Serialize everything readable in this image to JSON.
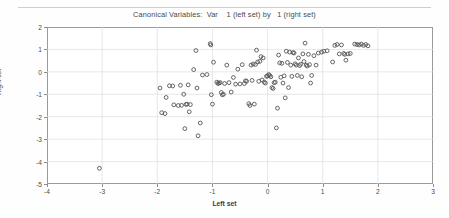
{
  "figure": {
    "title": "Canonical Variables:  Var    1 (left set) by   1 (right set)",
    "xlabel": "Left set",
    "ylabel": "Right set"
  },
  "chart_data": {
    "type": "scatter",
    "title": "Canonical Variables:  Var    1 (left set) by   1 (right set)",
    "xlabel": "Left set",
    "ylabel": "Right set",
    "xlim": [
      -4,
      3
    ],
    "ylim": [
      -5,
      2
    ],
    "xticks": [
      -4,
      -3,
      -2,
      -1,
      0,
      1,
      2,
      3
    ],
    "yticks": [
      -5,
      -4,
      -3,
      -2,
      -1,
      0,
      1,
      2
    ],
    "grid": true,
    "legend": null,
    "marker": "open-circle",
    "marker_color": "#555555",
    "series": [
      {
        "name": "observations",
        "points": [
          [
            -3.05,
            -4.3
          ],
          [
            -1.95,
            -0.72
          ],
          [
            -1.92,
            -1.82
          ],
          [
            -1.86,
            -1.86
          ],
          [
            -1.84,
            -1.14
          ],
          [
            -1.78,
            -0.62
          ],
          [
            -1.72,
            -0.63
          ],
          [
            -1.7,
            -1.47
          ],
          [
            -1.62,
            -1.5
          ],
          [
            -1.58,
            -0.6
          ],
          [
            -1.56,
            -1.49
          ],
          [
            -1.52,
            -1.0
          ],
          [
            -1.5,
            -2.53
          ],
          [
            -1.48,
            -1.45
          ],
          [
            -1.46,
            -1.44
          ],
          [
            -1.44,
            -0.58
          ],
          [
            -1.42,
            -1.78
          ],
          [
            -1.4,
            -1.46
          ],
          [
            -1.34,
            0.1
          ],
          [
            -1.3,
            0.95
          ],
          [
            -1.28,
            -0.72
          ],
          [
            -1.26,
            -2.85
          ],
          [
            -1.22,
            -2.28
          ],
          [
            -1.18,
            -0.14
          ],
          [
            -1.1,
            -0.12
          ],
          [
            -1.04,
            1.26
          ],
          [
            -1.03,
            1.2
          ],
          [
            -1.02,
            -1.02
          ],
          [
            -1.0,
            -1.44
          ],
          [
            -0.98,
            0.43
          ],
          [
            -0.92,
            -0.46
          ],
          [
            -0.9,
            -0.52
          ],
          [
            -0.88,
            -0.5
          ],
          [
            -0.86,
            -0.48
          ],
          [
            -0.84,
            -0.92
          ],
          [
            -0.82,
            -1.02
          ],
          [
            -0.8,
            -1.0
          ],
          [
            -0.78,
            -0.52
          ],
          [
            -0.74,
            0.3
          ],
          [
            -0.7,
            -0.48
          ],
          [
            -0.66,
            -0.9
          ],
          [
            -0.62,
            -0.25
          ],
          [
            -0.58,
            -0.55
          ],
          [
            -0.54,
            0.12
          ],
          [
            -0.5,
            -0.54
          ],
          [
            -0.46,
            0.32
          ],
          [
            -0.42,
            -0.52
          ],
          [
            -0.4,
            -0.4
          ],
          [
            -0.38,
            -0.42
          ],
          [
            -0.34,
            -1.42
          ],
          [
            -0.32,
            -1.5
          ],
          [
            -0.3,
            0.3
          ],
          [
            -0.28,
            -0.38
          ],
          [
            -0.26,
            0.35
          ],
          [
            -0.24,
            -1.44
          ],
          [
            -0.22,
            0.33
          ],
          [
            -0.2,
            0.97
          ],
          [
            -0.18,
            0.44
          ],
          [
            -0.16,
            -0.42
          ],
          [
            -0.14,
            0.47
          ],
          [
            -0.12,
            0.68
          ],
          [
            -0.1,
            -0.36
          ],
          [
            -0.08,
            0.62
          ],
          [
            -0.06,
            -0.46
          ],
          [
            -0.04,
            -0.5
          ],
          [
            -0.02,
            -0.2
          ],
          [
            0.0,
            -0.18
          ],
          [
            0.02,
            -0.12
          ],
          [
            0.04,
            -0.16
          ],
          [
            0.06,
            -0.22
          ],
          [
            0.08,
            -0.7
          ],
          [
            0.1,
            -0.74
          ],
          [
            0.12,
            -0.48
          ],
          [
            0.14,
            -0.46
          ],
          [
            0.16,
            -2.5
          ],
          [
            0.18,
            -1.62
          ],
          [
            0.2,
            0.75
          ],
          [
            0.22,
            0.4
          ],
          [
            0.24,
            -0.24
          ],
          [
            0.26,
            0.38
          ],
          [
            0.28,
            -0.5
          ],
          [
            0.3,
            -0.18
          ],
          [
            0.32,
            -1.16
          ],
          [
            0.34,
            0.92
          ],
          [
            0.36,
            0.42
          ],
          [
            0.38,
            -0.7
          ],
          [
            0.4,
            0.88
          ],
          [
            0.42,
            0.3
          ],
          [
            0.44,
            -0.2
          ],
          [
            0.46,
            0.86
          ],
          [
            0.48,
            0.84
          ],
          [
            0.5,
            0.36
          ],
          [
            0.52,
            0.3
          ],
          [
            0.54,
            -0.16
          ],
          [
            0.56,
            0.62
          ],
          [
            0.58,
            0.28
          ],
          [
            0.6,
            0.34
          ],
          [
            0.62,
            -0.22
          ],
          [
            0.64,
            0.8
          ],
          [
            0.66,
            0.46
          ],
          [
            0.68,
            1.28
          ],
          [
            0.7,
            0.3
          ],
          [
            0.72,
            0.26
          ],
          [
            0.74,
            0.78
          ],
          [
            0.76,
            0.32
          ],
          [
            0.78,
            -0.5
          ],
          [
            0.8,
            -0.16
          ],
          [
            0.84,
            0.72
          ],
          [
            0.88,
            0.3
          ],
          [
            0.92,
            0.84
          ],
          [
            0.98,
            0.88
          ],
          [
            1.02,
            0.92
          ],
          [
            1.08,
            0.94
          ],
          [
            1.18,
            0.44
          ],
          [
            1.22,
            1.18
          ],
          [
            1.26,
            1.22
          ],
          [
            1.3,
            0.8
          ],
          [
            1.34,
            1.2
          ],
          [
            1.38,
            0.82
          ],
          [
            1.4,
            0.78
          ],
          [
            1.42,
            0.52
          ],
          [
            1.46,
            0.8
          ],
          [
            1.5,
            0.82
          ],
          [
            1.58,
            1.24
          ],
          [
            1.62,
            1.22
          ],
          [
            1.66,
            1.2
          ],
          [
            1.7,
            1.24
          ],
          [
            1.74,
            1.18
          ],
          [
            1.78,
            1.22
          ],
          [
            1.82,
            1.16
          ]
        ]
      }
    ]
  }
}
